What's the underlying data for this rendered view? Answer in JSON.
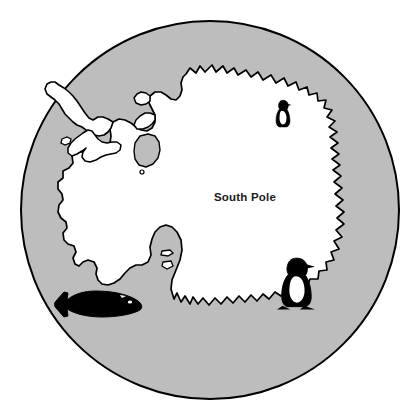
{
  "figure": {
    "name": "antarctica-south-pole-map",
    "width": 419,
    "height": 413,
    "background_color": "#ffffff"
  },
  "map": {
    "projection": "polar-azimuthal",
    "globe": {
      "name": "southern-ocean-disc",
      "center_x": 210,
      "center_y": 210,
      "radius": 189,
      "fill_color": "#bdbdbd",
      "stroke_color": "#000000",
      "stroke_width": 2
    },
    "landmass": {
      "name": "antarctica-continent",
      "fill_color": "#ffffff",
      "stroke_color": "#000000",
      "stroke_width": 1.6
    },
    "inner_feature": {
      "name": "interior-ice-shelf-outline",
      "fill_color": "#bdbdbd",
      "stroke_color": "#000000"
    }
  },
  "labels": {
    "south_pole": {
      "text": "South Pole",
      "x": 245,
      "y": 201,
      "color": "#1a1a1a",
      "font_size": "11.5px",
      "font_weight": "bold"
    }
  },
  "wildlife": [
    {
      "name": "penguin-icon-north",
      "species": "penguin",
      "x": 283,
      "y": 113,
      "scale": 0.58,
      "fill_color": "#000000",
      "location_note": "Queen Maud Land coast"
    },
    {
      "name": "penguin-icon-south",
      "species": "penguin",
      "x": 296,
      "y": 281,
      "scale": 0.92,
      "fill_color": "#000000",
      "location_note": "Ross Sea coast"
    },
    {
      "name": "whale-icon",
      "species": "whale",
      "x": 100,
      "y": 305,
      "scale": 1.0,
      "fill_color": "#000000",
      "location_note": "Southern Ocean, Bellingshausen Sea"
    }
  ],
  "colors": {
    "ocean_gray": "#bdbdbd",
    "land_white": "#ffffff",
    "outline_black": "#000000",
    "text_black": "#1a1a1a",
    "page_white": "#ffffff"
  }
}
